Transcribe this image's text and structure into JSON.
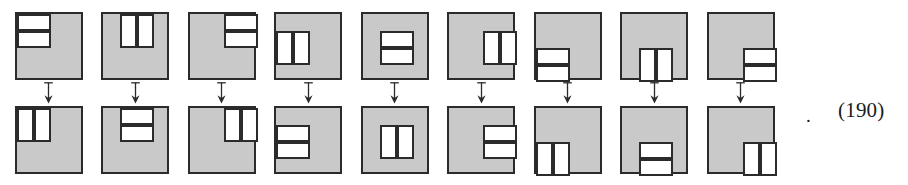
{
  "figure": {
    "equation_number": "(190)",
    "trailing_punctuation": ".",
    "arrow_icon": "down-arrow-icon",
    "colors": {
      "tile_fill": "#c9c9c9",
      "cell_fill": "#ffffff",
      "stroke": "#2b2b2b",
      "background": "#ffffff"
    },
    "transformation": "rotate-90",
    "pair_count": 9,
    "tile_grid": 4,
    "pairs": [
      {
        "index": 1,
        "top": {
          "name": "domino-pair-vertical-stack-top-left",
          "orientation": "stacked-horizontal-bars",
          "cells": [
            {
              "x": 0,
              "y": 0,
              "w": 2,
              "h": 1
            },
            {
              "x": 0,
              "y": 1,
              "w": 2,
              "h": 1
            }
          ]
        },
        "bottom": {
          "name": "domino-pair-side-by-side-top-left",
          "orientation": "side-by-side-vertical-bars",
          "cells": [
            {
              "x": 0,
              "y": 0,
              "w": 1,
              "h": 2
            },
            {
              "x": 1,
              "y": 0,
              "w": 1,
              "h": 2
            }
          ]
        }
      },
      {
        "index": 2,
        "top": {
          "name": "domino-pair-side-by-side-top-center",
          "orientation": "side-by-side-vertical-bars",
          "cells": [
            {
              "x": 1,
              "y": 0,
              "w": 1,
              "h": 2
            },
            {
              "x": 2,
              "y": 0,
              "w": 1,
              "h": 2
            }
          ]
        },
        "bottom": {
          "name": "domino-pair-vertical-stack-top-center",
          "orientation": "stacked-horizontal-bars",
          "cells": [
            {
              "x": 1,
              "y": 0,
              "w": 2,
              "h": 1
            },
            {
              "x": 1,
              "y": 1,
              "w": 2,
              "h": 1
            }
          ]
        }
      },
      {
        "index": 3,
        "top": {
          "name": "domino-pair-vertical-stack-top-right",
          "orientation": "stacked-horizontal-bars",
          "cells": [
            {
              "x": 2,
              "y": 0,
              "w": 2,
              "h": 1
            },
            {
              "x": 2,
              "y": 1,
              "w": 2,
              "h": 1
            }
          ]
        },
        "bottom": {
          "name": "domino-pair-side-by-side-top-right",
          "orientation": "side-by-side-vertical-bars",
          "cells": [
            {
              "x": 2,
              "y": 0,
              "w": 1,
              "h": 2
            },
            {
              "x": 3,
              "y": 0,
              "w": 1,
              "h": 2
            }
          ]
        }
      },
      {
        "index": 4,
        "top": {
          "name": "domino-pair-side-by-side-middle-left",
          "orientation": "side-by-side-vertical-bars",
          "cells": [
            {
              "x": 0,
              "y": 1,
              "w": 1,
              "h": 2
            },
            {
              "x": 1,
              "y": 1,
              "w": 1,
              "h": 2
            }
          ]
        },
        "bottom": {
          "name": "domino-pair-vertical-stack-middle-left",
          "orientation": "stacked-horizontal-bars",
          "cells": [
            {
              "x": 0,
              "y": 1,
              "w": 2,
              "h": 1
            },
            {
              "x": 0,
              "y": 2,
              "w": 2,
              "h": 1
            }
          ]
        }
      },
      {
        "index": 5,
        "top": {
          "name": "domino-pair-vertical-stack-center",
          "orientation": "stacked-horizontal-bars",
          "cells": [
            {
              "x": 1,
              "y": 1,
              "w": 2,
              "h": 1
            },
            {
              "x": 1,
              "y": 2,
              "w": 2,
              "h": 1
            }
          ]
        },
        "bottom": {
          "name": "domino-pair-side-by-side-center",
          "orientation": "side-by-side-vertical-bars",
          "cells": [
            {
              "x": 1,
              "y": 1,
              "w": 1,
              "h": 2
            },
            {
              "x": 2,
              "y": 1,
              "w": 1,
              "h": 2
            }
          ]
        }
      },
      {
        "index": 6,
        "top": {
          "name": "domino-pair-side-by-side-middle-right",
          "orientation": "side-by-side-vertical-bars",
          "cells": [
            {
              "x": 2,
              "y": 1,
              "w": 1,
              "h": 2
            },
            {
              "x": 3,
              "y": 1,
              "w": 1,
              "h": 2
            }
          ]
        },
        "bottom": {
          "name": "domino-pair-vertical-stack-middle-right",
          "orientation": "stacked-horizontal-bars",
          "cells": [
            {
              "x": 2,
              "y": 1,
              "w": 2,
              "h": 1
            },
            {
              "x": 2,
              "y": 2,
              "w": 2,
              "h": 1
            }
          ]
        }
      },
      {
        "index": 7,
        "top": {
          "name": "domino-pair-vertical-stack-bottom-left",
          "orientation": "stacked-horizontal-bars",
          "cells": [
            {
              "x": 0,
              "y": 2,
              "w": 2,
              "h": 1
            },
            {
              "x": 0,
              "y": 3,
              "w": 2,
              "h": 1
            }
          ]
        },
        "bottom": {
          "name": "domino-pair-side-by-side-bottom-left",
          "orientation": "side-by-side-vertical-bars",
          "cells": [
            {
              "x": 0,
              "y": 2,
              "w": 1,
              "h": 2
            },
            {
              "x": 1,
              "y": 2,
              "w": 1,
              "h": 2
            }
          ]
        }
      },
      {
        "index": 8,
        "top": {
          "name": "domino-pair-side-by-side-bottom-center",
          "orientation": "side-by-side-vertical-bars",
          "cells": [
            {
              "x": 1,
              "y": 2,
              "w": 1,
              "h": 2
            },
            {
              "x": 2,
              "y": 2,
              "w": 1,
              "h": 2
            }
          ]
        },
        "bottom": {
          "name": "domino-pair-vertical-stack-bottom-center",
          "orientation": "stacked-horizontal-bars",
          "cells": [
            {
              "x": 1,
              "y": 2,
              "w": 2,
              "h": 1
            },
            {
              "x": 1,
              "y": 3,
              "w": 2,
              "h": 1
            }
          ]
        }
      },
      {
        "index": 9,
        "top": {
          "name": "domino-pair-vertical-stack-bottom-right",
          "orientation": "stacked-horizontal-bars",
          "cells": [
            {
              "x": 2,
              "y": 2,
              "w": 2,
              "h": 1
            },
            {
              "x": 2,
              "y": 3,
              "w": 2,
              "h": 1
            }
          ]
        },
        "bottom": {
          "name": "domino-pair-side-by-side-bottom-right",
          "orientation": "side-by-side-vertical-bars",
          "cells": [
            {
              "x": 2,
              "y": 2,
              "w": 1,
              "h": 2
            },
            {
              "x": 3,
              "y": 2,
              "w": 1,
              "h": 2
            }
          ]
        }
      }
    ]
  }
}
